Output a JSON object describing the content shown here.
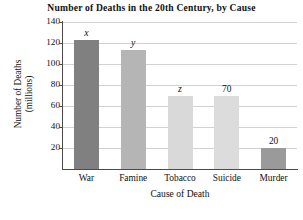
{
  "chart_data": {
    "type": "bar",
    "title": "Number of Deaths in the 20th Century, by Cause",
    "xlabel": "Cause of Death",
    "ylabel_line1": "Number of Deaths",
    "ylabel_line2": "(millions)",
    "categories": [
      "War",
      "Famine",
      "Tobacco",
      "Suicide",
      "Murder"
    ],
    "values": [
      123,
      113,
      70,
      70,
      20
    ],
    "data_labels": [
      "x",
      "y",
      "z",
      "70",
      "20"
    ],
    "data_label_is_variable": [
      true,
      true,
      true,
      false,
      false
    ],
    "bar_colors": [
      "#808080",
      "#b5b5b5",
      "#d9d9d9",
      "#dcdcdc",
      "#9a9a9a"
    ],
    "ylim": [
      0,
      140
    ],
    "yticks": [
      140,
      120,
      100,
      80,
      60,
      40,
      20
    ],
    "ytick_labels": [
      "140",
      "120",
      "100",
      "80",
      "60",
      "40",
      "20"
    ],
    "grid": "horizontal",
    "legend": "none",
    "axis_color": "#4a4a4a",
    "grid_color": "#d2d2d2"
  }
}
